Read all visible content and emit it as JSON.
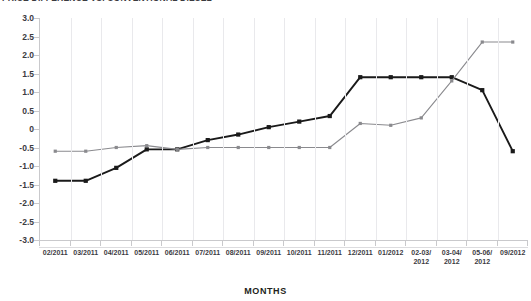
{
  "chart_data": {
    "type": "line",
    "title": "PRICE DIFFERENCE VS. CONVENTIONAL DIESEL",
    "xlabel": "MONTHS",
    "ylabel": "",
    "ylim": [
      -3.0,
      3.0
    ],
    "ystep": 0.5,
    "grid": "vertical-only",
    "legend": "none",
    "categories": [
      "02/2011",
      "03/2011",
      "04/2011",
      "05/2011",
      "06/2011",
      "07/2011",
      "08/2011",
      "09/2011",
      "10/2011",
      "11/2011",
      "12/2011",
      "01/2012",
      "02-03/\n2012",
      "03-04/\n2012",
      "05-06/\n2012",
      "09/2012"
    ],
    "ytick_labels": [
      "3.0",
      "2.5",
      "2.0",
      "1.5",
      "1.0",
      "0.5",
      "0",
      "-0.5",
      "-1.0",
      "-1.5",
      "-2.0",
      "-2.5",
      "-3.0"
    ],
    "ytick_values": [
      3.0,
      2.5,
      2.0,
      1.5,
      1.0,
      0.5,
      0,
      -0.5,
      -1.0,
      -1.5,
      -2.0,
      -2.5,
      -3.0
    ],
    "series": [
      {
        "name": "series-black",
        "color": "#1a1a1a",
        "marker": "square",
        "values": [
          -1.4,
          -1.4,
          -1.05,
          -0.55,
          -0.55,
          -0.3,
          -0.15,
          0.05,
          0.2,
          0.35,
          1.4,
          1.4,
          1.4,
          1.4,
          1.05,
          -0.6
        ]
      },
      {
        "name": "series-gray",
        "color": "#8a8a8e",
        "marker": "square",
        "values": [
          -0.6,
          -0.6,
          -0.5,
          -0.45,
          -0.55,
          -0.5,
          -0.5,
          -0.5,
          -0.5,
          -0.5,
          0.15,
          0.1,
          0.3,
          1.3,
          2.35,
          2.35
        ]
      }
    ]
  }
}
